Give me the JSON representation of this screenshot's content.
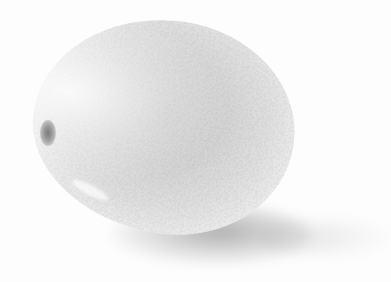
{
  "image": {
    "subject": "citrus fruit (lemon)",
    "style": "grayscale photograph",
    "colors": {
      "background": "#fdfdfd",
      "fruit_core": "#c9c9c9",
      "fruit_edge": "#f7f7f7",
      "shadow": "#969696",
      "stem": "#7a7a7a"
    }
  }
}
